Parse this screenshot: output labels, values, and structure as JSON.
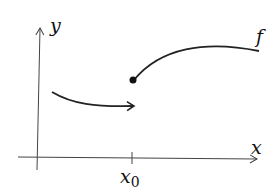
{
  "diagram": {
    "axes": {
      "x_label": "x",
      "y_label": "y"
    },
    "tick_label": "x",
    "tick_subscript": "0",
    "function_label": "f",
    "colors": {
      "stroke": "#222222",
      "axis": "#444444"
    }
  }
}
